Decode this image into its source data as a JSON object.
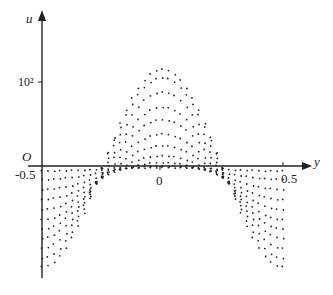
{
  "chart_data": {
    "type": "scatter",
    "title": "",
    "xlabel": "y",
    "ylabel": "u",
    "origin_label": "O",
    "x_ticks": [
      {
        "value": -0.5,
        "label": "-0.5"
      },
      {
        "value": 0,
        "label": "0"
      },
      {
        "value": 0.5,
        "label": "0.5"
      }
    ],
    "y_ticks": [
      {
        "value": 100,
        "label": "10²"
      }
    ],
    "xlim": [
      -0.5,
      0.5
    ],
    "ylim": [
      -135,
      160
    ],
    "grid": false,
    "legend": "none",
    "marker": "dot",
    "series": [
      {
        "name": "curve-1",
        "center": 115,
        "edge": -120
      },
      {
        "name": "curve-2",
        "center": 105,
        "edge": -110
      },
      {
        "name": "curve-3",
        "center": 88,
        "edge": -98
      },
      {
        "name": "curve-4",
        "center": 70,
        "edge": -86
      },
      {
        "name": "curve-5",
        "center": 55,
        "edge": -75
      },
      {
        "name": "curve-6",
        "center": 38,
        "edge": -64
      },
      {
        "name": "curve-7",
        "center": 24,
        "edge": -52
      },
      {
        "name": "curve-8",
        "center": 12,
        "edge": -40
      },
      {
        "name": "curve-9",
        "center": 4,
        "edge": -28
      },
      {
        "name": "curve-10",
        "center": 0,
        "edge": -16
      },
      {
        "name": "curve-11",
        "center": -2,
        "edge": -6
      }
    ],
    "points_per_curve": 41
  },
  "labels": {
    "u_axis": "u",
    "y_axis": "y",
    "origin": "O",
    "tick_10_2": "10²",
    "tick_neg_half": "-0.5",
    "tick_zero": "0",
    "tick_half": "0.5"
  }
}
